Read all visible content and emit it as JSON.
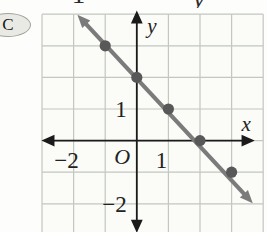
{
  "page": {
    "background": "#fdfdfb"
  },
  "badge": {
    "label": "C",
    "fill": "#eaeae5",
    "stroke": "#a3a29c"
  },
  "remnants": {
    "left_glyph": "1",
    "right_glyph": "y",
    "note": "bottoms of letters from a cropped line of text above the figure"
  },
  "chart_data": {
    "type": "line",
    "title": "",
    "points": [
      [
        -1,
        3
      ],
      [
        0,
        2
      ],
      [
        1,
        1
      ],
      [
        2,
        0
      ],
      [
        3,
        -1
      ]
    ],
    "line_start": [
      -1.88,
      3.98
    ],
    "line_end": [
      3.67,
      -1.98
    ],
    "grid": {
      "grid_on": true,
      "x_min": -3,
      "x_max": 4,
      "y_min": -2,
      "y_max": 4
    },
    "axes": {
      "xlabel": "x",
      "ylabel": "y",
      "origin_label": "O",
      "x_axis_span": [
        -2.95,
        3.66
      ],
      "y_axis_span": [
        -2.85,
        4.05
      ]
    },
    "x_tick_labels": [
      {
        "value": -2,
        "label": "−2"
      },
      {
        "value": 1,
        "label": "1"
      }
    ],
    "y_tick_labels": [
      {
        "value": 1,
        "label": "1"
      },
      {
        "value": -2,
        "label": "−2"
      }
    ],
    "colors": {
      "plot_bg": "#fbfbf7",
      "grid": "#c2c7c0",
      "axis": "#1b1b1b",
      "line": "#7b7b7b",
      "point": "#585858",
      "label": "#222222"
    }
  }
}
